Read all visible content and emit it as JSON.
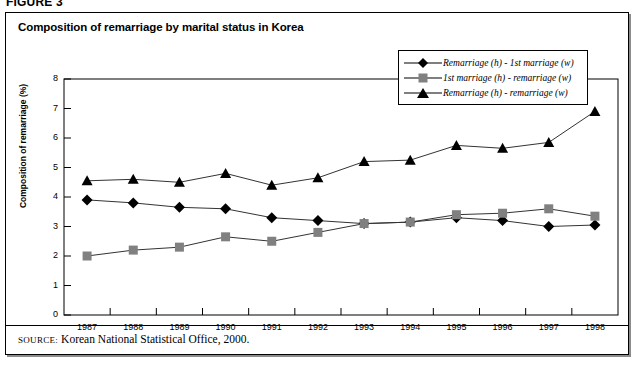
{
  "figure": {
    "label": "FIGURE 3"
  },
  "chart_title": "Composition of remarriage by marital status in Korea",
  "source": {
    "label": "SOURCE:",
    "text": "Korean National Statistical Office, 2000."
  },
  "axes": {
    "y_title": "Composition of remarriage (%)",
    "y_ticks": [
      "0",
      "1",
      "2",
      "3",
      "4",
      "5",
      "6",
      "7",
      "8"
    ],
    "x_ticks": [
      "1987",
      "1988",
      "1989",
      "1990",
      "1991",
      "1992",
      "1993",
      "1994",
      "1995",
      "1996",
      "1997",
      "1998"
    ]
  },
  "legend": {
    "position": "top-right",
    "items": [
      {
        "label": "Remarriage (h) - 1st marriage (w)",
        "marker": "diamond",
        "color": "#000000"
      },
      {
        "label": "1st marriage (h) - remarriage (w)",
        "marker": "square",
        "color": "#808080"
      },
      {
        "label": "Remarriage (h) - remarriage (w)",
        "marker": "triangle",
        "color": "#000000"
      }
    ]
  },
  "chart_data": {
    "type": "line",
    "title": "Composition of remarriage by marital status in Korea",
    "xlabel": "",
    "ylabel": "Composition of remarriage (%)",
    "ylim": [
      0,
      8
    ],
    "ytick_step": 1,
    "grid": false,
    "legend_position": "top-right",
    "categories": [
      "1987",
      "1988",
      "1989",
      "1990",
      "1991",
      "1992",
      "1993",
      "1994",
      "1995",
      "1996",
      "1997",
      "1998"
    ],
    "series": [
      {
        "name": "Remarriage (h) - 1st marriage (w)",
        "marker": "diamond",
        "color": "#000000",
        "values": [
          3.9,
          3.8,
          3.65,
          3.6,
          3.3,
          3.2,
          3.1,
          3.15,
          3.3,
          3.2,
          3.0,
          3.05
        ]
      },
      {
        "name": "1st marriage (h) - remarriage (w)",
        "marker": "square",
        "color": "#808080",
        "values": [
          2.0,
          2.2,
          2.3,
          2.65,
          2.5,
          2.8,
          3.1,
          3.15,
          3.4,
          3.45,
          3.6,
          3.35
        ]
      },
      {
        "name": "Remarriage (h) - remarriage (w)",
        "marker": "triangle",
        "color": "#000000",
        "values": [
          4.55,
          4.6,
          4.5,
          4.8,
          4.4,
          4.65,
          5.2,
          5.25,
          5.75,
          5.65,
          5.85,
          6.9
        ]
      }
    ]
  }
}
